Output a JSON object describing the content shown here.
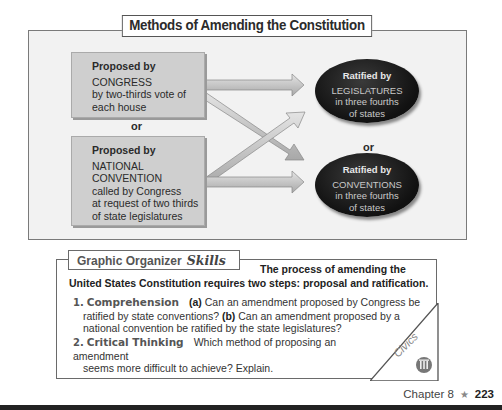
{
  "diagram": {
    "title": "Methods of Amending the Constitution",
    "proposals": [
      {
        "head": "Proposed by",
        "lines": [
          "CONGRESS",
          "by two-thirds vote of",
          "each house"
        ]
      },
      {
        "head": "Proposed by",
        "lines": [
          "NATIONAL",
          "CONVENTION",
          "called by Congress",
          "at request of two thirds",
          "of state legislatures"
        ]
      }
    ],
    "proposal_separator": "or",
    "ratifications": [
      {
        "head": "Ratified by",
        "lines": [
          "LEGISLATURES",
          "in three fourths",
          "of states"
        ]
      },
      {
        "head": "Ratified by",
        "lines": [
          "CONVENTIONS",
          "in three fourths",
          "of states"
        ]
      }
    ],
    "ratification_separator": "or"
  },
  "skills": {
    "tab_label": "Graphic Organizer",
    "tab_script": "Skills",
    "intro_line1": "The process of amending the",
    "intro_line2": "United States Constitution requires two steps: proposal and ratification.",
    "questions": [
      {
        "num": "1.",
        "label": "Comprehension",
        "part_a": "(a)",
        "text_a": " Can an amendment proposed by Congress be",
        "text_a2": "ratified by state conventions? ",
        "part_b": "(b)",
        "text_b": " Can an amendment proposed by a",
        "text_b2": "national convention be ratified by the state legislatures?"
      },
      {
        "num": "2.",
        "label": "Critical Thinking",
        "text": "Which method of proposing an amendment",
        "text2": "seems more difficult to achieve? Explain."
      }
    ],
    "corner_label": "Civics",
    "corner_icon": "capitol-columns-icon"
  },
  "footer": {
    "chapter": "Chapter 8",
    "star": "★",
    "page": "223"
  }
}
